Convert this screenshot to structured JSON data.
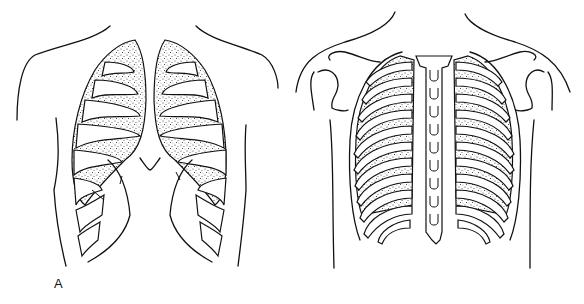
{
  "figure": {
    "panels": [
      {
        "id": "A",
        "label": "A",
        "description": "Anterior view of the thorax: ribs and lungs with stippled lung tissue, open at the front (sternum removed)"
      },
      {
        "id": "B",
        "label": "B",
        "description": "Posterior view of the thorax: rib cage and vertebral column with stippled lungs visible between ribs"
      }
    ]
  }
}
